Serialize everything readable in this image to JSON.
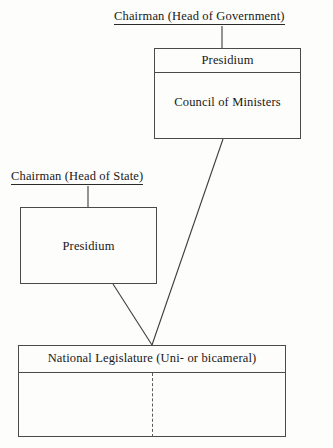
{
  "diagram": {
    "title_semantics": "government-structure-chart",
    "labels": {
      "head_of_government": "Chairman (Head of Government)",
      "head_of_state": "Chairman (Head of State)"
    },
    "boxes": {
      "presidium_government": {
        "header": "Presidium",
        "body": "Council of Ministers"
      },
      "presidium_state": {
        "header": "Presidium"
      },
      "legislature": {
        "header": "National Legislature (Uni- or bicameral)",
        "body_left": "",
        "body_right": ""
      }
    },
    "colors": {
      "ink": "#181818",
      "rule": "#4a4a4a",
      "dashed_rule": "#5a5a5a",
      "page": "#fdfdfb"
    },
    "connectors": [
      {
        "name": "head-of-government-to-presidium",
        "x1": 222,
        "y1": 26,
        "x2": 222,
        "y2": 48,
        "style": "solid"
      },
      {
        "name": "head-of-state-to-presidium",
        "x1": 88,
        "y1": 186,
        "x2": 88,
        "y2": 207,
        "style": "solid"
      },
      {
        "name": "council-of-ministers-to-legislature",
        "x1": 223,
        "y1": 139,
        "x2": 152,
        "y2": 345,
        "style": "solid"
      },
      {
        "name": "state-presidium-to-legislature",
        "x1": 113,
        "y1": 284,
        "x2": 152,
        "y2": 345,
        "style": "solid"
      }
    ]
  }
}
